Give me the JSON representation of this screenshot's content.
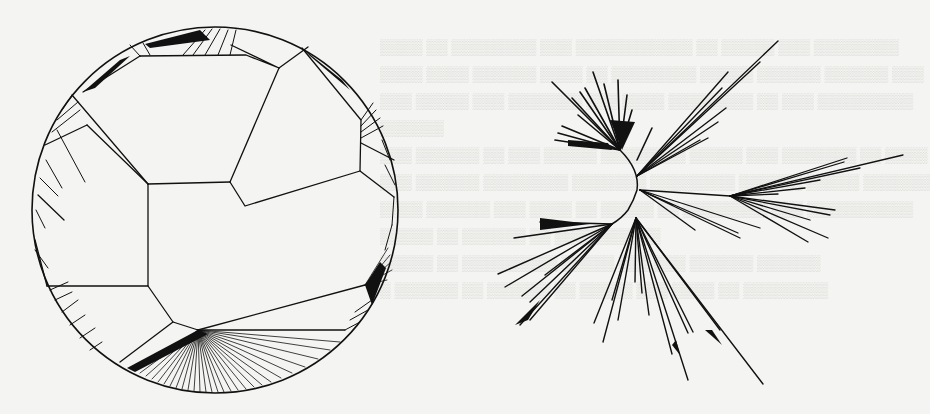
{
  "page": {
    "background": "#f4f4f2",
    "ink_color": "#111111",
    "show_through_text_visible": true,
    "show_through_text_legible": false
  },
  "figures": [
    {
      "id": "left",
      "kind": "hyperbolic-disk-tree-layout",
      "description": "Tree drawn inside a Poincare-style disk: large central polygonal cells with dense fan-shaped edge clusters crowding the boundary circle.",
      "disk": {
        "cx": 215,
        "cy": 210,
        "r": 183
      }
    },
    {
      "id": "right",
      "kind": "radial-unrooted-tree-layout",
      "description": "Unrooted radial tree with a short curved trunk and long branch clusters radiating in all directions.",
      "center": {
        "x": 637,
        "y": 190
      }
    }
  ]
}
